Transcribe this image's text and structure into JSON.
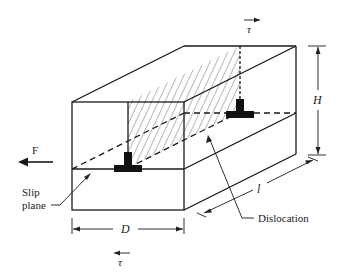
{
  "diagram": {
    "labels": {
      "tau_top": "τ",
      "tau_bottom": "τ",
      "force": "F",
      "slip_plane_line1": "Slip",
      "slip_plane_line2": "plane",
      "dislocation": "Dislocation",
      "height": "H",
      "depth": "D",
      "length": "l"
    }
  }
}
